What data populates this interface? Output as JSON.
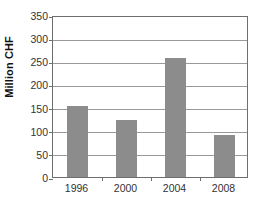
{
  "chart_data": {
    "type": "bar",
    "title": "",
    "xlabel": "",
    "ylabel": "Million CHF",
    "categories": [
      "1996",
      "2000",
      "2004",
      "2008"
    ],
    "values": [
      154,
      123,
      258,
      91
    ],
    "series": [
      {
        "name": "Million CHF",
        "values": [
          154,
          123,
          258,
          91
        ]
      }
    ],
    "ylim": [
      0,
      350
    ],
    "y_ticks": [
      0,
      50,
      100,
      150,
      200,
      250,
      300,
      350
    ],
    "y_tick_labels": [
      "0",
      "50",
      "100",
      "150",
      "200",
      "250",
      "300",
      "350"
    ],
    "grid": true,
    "grid_axis": "y",
    "legend": false,
    "legend_position": "none",
    "bar_color": "#8c8c8c",
    "axis_color": "#6e6e6e",
    "grid_color": "#9a9a9a",
    "background": "#ffffff"
  }
}
